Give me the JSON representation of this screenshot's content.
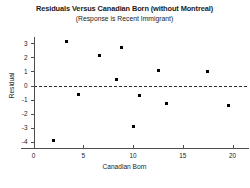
{
  "chart_data": {
    "type": "scatter",
    "title": "Residuals Versus Canadian Born (without Montreal)",
    "subtitle": "(Response is Recent Immigrant)",
    "xlabel": "Canadian Born",
    "ylabel": "Residual",
    "xlim": [
      -1.2,
      22.0
    ],
    "ylim": [
      -4.6,
      3.5
    ],
    "xticks": [
      0,
      5,
      10,
      15,
      20
    ],
    "yticks": [
      3,
      2,
      1,
      0,
      -1,
      -2,
      -3,
      -4
    ],
    "xtick_labels": [
      "0",
      "5",
      "10",
      "15",
      "20"
    ],
    "ytick_labels": [
      "3",
      "2",
      "1",
      "0",
      "-1",
      "-2",
      "-3",
      "-4"
    ],
    "grid": false,
    "legend": null,
    "reference_line": {
      "orientation": "horizontal",
      "y": 0,
      "style": "dashed",
      "color": "#2b2b2b"
    },
    "marker": {
      "shape": "square",
      "color": "#000000",
      "size": 3
    },
    "points": [
      {
        "x": 2.0,
        "y": -3.9
      },
      {
        "x": 3.3,
        "y": 3.1
      },
      {
        "x": 4.5,
        "y": -0.65
      },
      {
        "x": 6.6,
        "y": 2.1
      },
      {
        "x": 8.3,
        "y": 0.4
      },
      {
        "x": 8.8,
        "y": 2.7
      },
      {
        "x": 10.0,
        "y": -2.9
      },
      {
        "x": 10.7,
        "y": -0.7
      },
      {
        "x": 12.6,
        "y": 1.05
      },
      {
        "x": 13.4,
        "y": -1.3
      },
      {
        "x": 17.5,
        "y": 1.0
      },
      {
        "x": 19.6,
        "y": -1.4
      }
    ]
  }
}
